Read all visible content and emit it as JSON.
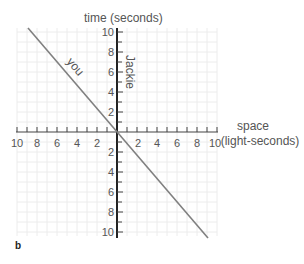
{
  "diagram": {
    "panel_label": "b",
    "y_axis_title": "time (seconds)",
    "x_axis_title_line1": "space",
    "x_axis_title_line2": "(light-seconds)",
    "worldline_vertical_label": "Jackie",
    "worldline_diagonal_label": "you",
    "x_tick_labels_left": [
      "10",
      "8",
      "6",
      "4",
      "2"
    ],
    "x_tick_labels_right": [
      "2",
      "4",
      "6",
      "8",
      "10"
    ],
    "y_tick_labels_up": [
      "10",
      "8",
      "6",
      "4",
      "2"
    ],
    "y_tick_labels_down": [
      "2",
      "4",
      "6",
      "8",
      "10"
    ],
    "colors": {
      "grid": "#e8e8e8",
      "axis": "#333333",
      "worldline": "#777777",
      "text": "#555555"
    }
  }
}
